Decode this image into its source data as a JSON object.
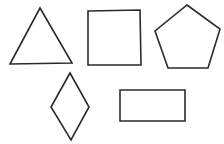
{
  "canvas": {
    "width": 224,
    "height": 144,
    "background": "#ffffff"
  },
  "stroke_color": "#2a2a2a",
  "shapes": [
    {
      "name": "triangle",
      "type": "polygon",
      "points": "40,8 10,64 72,63"
    },
    {
      "name": "square",
      "type": "polygon",
      "points": "88,11 140,10 141,65 88,65"
    },
    {
      "name": "pentagon",
      "type": "polygon",
      "points": "187,5 220,29 208,68 168,68 155,31"
    },
    {
      "name": "rhombus",
      "type": "polygon",
      "points": "70,73 89,107 71,140 51,107"
    },
    {
      "name": "rectangle",
      "type": "polygon",
      "points": "120,90 185,90 185,121 120,121"
    }
  ]
}
